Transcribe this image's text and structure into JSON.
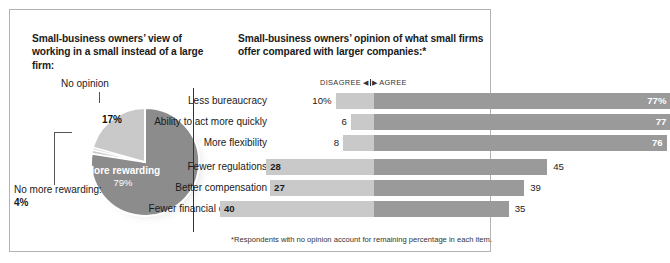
{
  "left": {
    "title": "Small-business owners’ view of working in a small instead of a large firm:",
    "labels": {
      "no_opinion": "No opinion",
      "no_opinion_value": "17%",
      "more_rewarding": "More rewarding",
      "more_rewarding_value": "79%",
      "no_more_rewarding": "No more rewarding:",
      "no_more_rewarding_value": "4%"
    }
  },
  "right": {
    "title": "Small-business owners’ opinion of what small firms offer compared with larger companies:*",
    "axis": {
      "disagree": "DISAGREE",
      "left_arrow": "◀",
      "right_arrow": "▶",
      "agree": "AGREE"
    },
    "footnote": "*Respondents with no opinion account for remaining percentage in each item."
  },
  "colors": {
    "dark_gray": "#9a9a9a",
    "light_gray": "#c9c9c9",
    "pie_dark": "#8c8c8c",
    "pie_light": "#c9c9c9",
    "border": "#b3b3b3",
    "axis": "#333333"
  },
  "chart_data": [
    {
      "type": "pie",
      "title": "Small-business owners’ view of working in a small instead of a large firm:",
      "categories": [
        "More rewarding",
        "No opinion",
        "No more rewarding"
      ],
      "values": [
        79,
        17,
        4
      ],
      "labels": [
        "79%",
        "17%",
        "4%"
      ],
      "unit": "%",
      "legend": "none"
    },
    {
      "type": "bar",
      "orientation": "horizontal",
      "layout": "diverging",
      "title": "Small-business owners’ opinion of what small firms offer compared with larger companies:*",
      "xlabel": "",
      "ylabel": "",
      "grid": false,
      "legend": "header",
      "categories": [
        "Less bureaucracy",
        "Ability to act more quickly",
        "More flexibility",
        "Fewer regulations",
        "Better compensation",
        "Fewer financial constraints"
      ],
      "series": [
        {
          "name": "DISAGREE",
          "values": [
            10,
            6,
            8,
            28,
            27,
            40
          ],
          "labels": [
            "10%",
            "6",
            "8",
            "28",
            "27",
            "40"
          ]
        },
        {
          "name": "AGREE",
          "values": [
            77,
            77,
            76,
            45,
            39,
            35
          ],
          "labels": [
            "77%",
            "77",
            "76",
            "45",
            "39",
            "35"
          ]
        }
      ],
      "footnote": "*Respondents with no opinion account for remaining percentage in each item."
    }
  ],
  "rows": [
    {
      "label": "Less bureaucracy",
      "dis": "10%",
      "agr": "77%",
      "dis_v": 10,
      "agr_v": 77
    },
    {
      "label": "Ability to act more quickly",
      "dis": "6",
      "agr": "77",
      "dis_v": 6,
      "agr_v": 77
    },
    {
      "label": "More flexibility",
      "dis": "8",
      "agr": "76",
      "dis_v": 8,
      "agr_v": 76
    },
    {
      "label": "Fewer regulations",
      "dis": "28",
      "agr": "45",
      "dis_v": 28,
      "agr_v": 45
    },
    {
      "label": "Better compensation",
      "dis": "27",
      "agr": "39",
      "dis_v": 27,
      "agr_v": 39
    },
    {
      "label": "Fewer financial constraints",
      "dis": "40",
      "agr": "35",
      "dis_v": 40,
      "agr_v": 35
    }
  ]
}
